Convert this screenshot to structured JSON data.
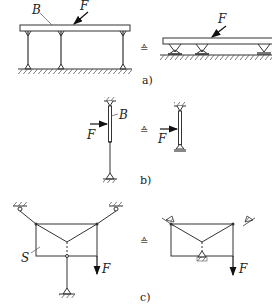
{
  "figure": {
    "panels": [
      {
        "id": "a",
        "caption": "a)",
        "left_labels": {
          "beam": "B",
          "force": "F"
        },
        "right_labels": {
          "force": "F"
        },
        "equivalence_symbol": "≙"
      },
      {
        "id": "b",
        "caption": "b)",
        "left_labels": {
          "member": "B",
          "force": "F"
        },
        "right_labels": {
          "force": "F"
        },
        "equivalence_symbol": "≙"
      },
      {
        "id": "c",
        "caption": "c)",
        "left_labels": {
          "structure": "S",
          "force": "F"
        },
        "right_labels": {
          "force": "F"
        },
        "equivalence_symbol": "≙"
      }
    ],
    "colors": {
      "line": "#333333",
      "background": "#ffffff"
    }
  }
}
